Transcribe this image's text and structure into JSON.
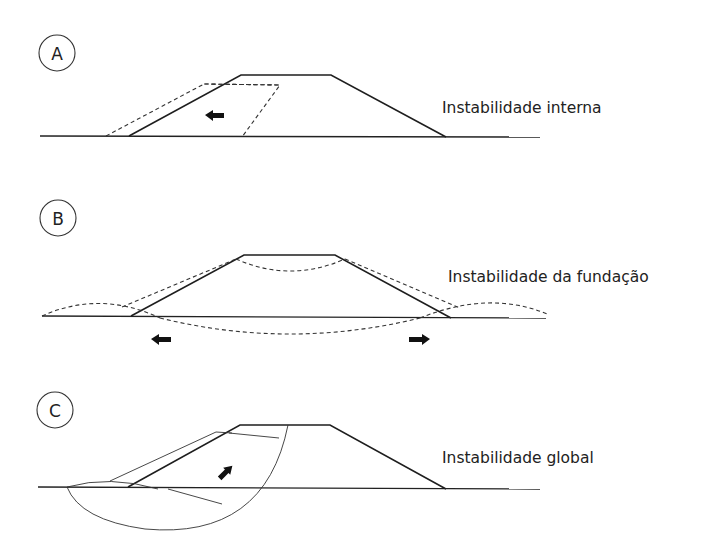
{
  "diagram": {
    "panels": [
      {
        "id": "A",
        "letter": "A",
        "caption": "Instabilidade interna",
        "description": "Embankment with internal sliding wedge (dashed) displaced left",
        "arrow_direction": "left"
      },
      {
        "id": "B",
        "letter": "B",
        "caption": "Instabilidade da fundação",
        "description": "Embankment spreading with foundation heave on both sides (dashed)",
        "arrow_directions": [
          "left",
          "right"
        ]
      },
      {
        "id": "C",
        "letter": "C",
        "caption": "Instabilidade global",
        "description": "Circular slip surface passing through embankment and foundation",
        "arrow_direction": "down-left"
      }
    ],
    "colors": {
      "line": "#1e1e1e",
      "background": "#ffffff"
    }
  }
}
